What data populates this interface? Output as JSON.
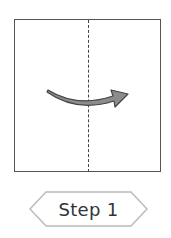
{
  "diagram": {
    "paper": {
      "border_color": "#555555",
      "fill": "#ffffff"
    },
    "fold_line": {
      "style": "dashed",
      "orientation": "vertical",
      "color": "#444444"
    },
    "arrow": {
      "direction": "right",
      "shape": "curved",
      "fill": "#888888",
      "outline": "#444444"
    },
    "step_label": {
      "text": "Step 1",
      "shape": "hexagon",
      "border_color": "#bbbbbb"
    }
  }
}
